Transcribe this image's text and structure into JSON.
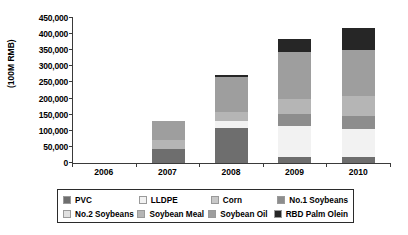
{
  "chart_data": {
    "type": "bar",
    "subtype": "stacked-column",
    "title": "",
    "xlabel": "",
    "ylabel": "(100M RMB)",
    "categories": [
      "2006",
      "2007",
      "2008",
      "2009",
      "2010"
    ],
    "ylim": [
      0,
      450000
    ],
    "ytick_step": 50000,
    "ytick_labels": [
      "0",
      "50,000",
      "100,000",
      "150,000",
      "200,000",
      "250,000",
      "300,000",
      "350,000",
      "400,000",
      "450,000"
    ],
    "grid": false,
    "legend_position": "bottom",
    "series": [
      {
        "name": "PVC",
        "color": "#6e6e6e",
        "values": [
          0,
          42000,
          108000,
          20000,
          18000
        ]
      },
      {
        "name": "LLDPE",
        "color": "#f2f2f2",
        "values": [
          0,
          0,
          22000,
          93000,
          88000
        ]
      },
      {
        "name": "Corn",
        "color": "#c8c8c8",
        "values": [
          0,
          0,
          0,
          0,
          0
        ]
      },
      {
        "name": "No.1 Soybeans",
        "color": "#8d8d8d",
        "values": [
          0,
          0,
          0,
          38000,
          40000
        ]
      },
      {
        "name": "No.2 Soybeans",
        "color": "#e0e0e0",
        "values": [
          0,
          0,
          0,
          0,
          0
        ]
      },
      {
        "name": "Soybean Meal",
        "color": "#b5b5b5",
        "values": [
          0,
          30000,
          27000,
          47000,
          62000
        ]
      },
      {
        "name": "Soybean Oil",
        "color": "#9e9e9e",
        "values": [
          0,
          58000,
          107000,
          145000,
          140000
        ]
      },
      {
        "name": "RBD Palm Olein",
        "color": "#262626",
        "values": [
          0,
          0,
          6000,
          40000,
          67000
        ]
      }
    ],
    "totals": [
      0,
      130000,
      270000,
      383000,
      415000
    ]
  },
  "legend": {
    "row1": [
      {
        "label": "PVC",
        "color": "#6e6e6e"
      },
      {
        "label": "LLDPE",
        "color": "#f2f2f2"
      },
      {
        "label": "Corn",
        "color": "#c8c8c8"
      },
      {
        "label": "No.1 Soybeans",
        "color": "#8d8d8d"
      }
    ],
    "row2": [
      {
        "label": "No.2 Soybeans",
        "color": "#e0e0e0"
      },
      {
        "label": "Soybean Meal",
        "color": "#b5b5b5"
      },
      {
        "label": "Soybean Oil",
        "color": "#9e9e9e"
      },
      {
        "label": "RBD Palm Olein",
        "color": "#262626"
      }
    ]
  }
}
